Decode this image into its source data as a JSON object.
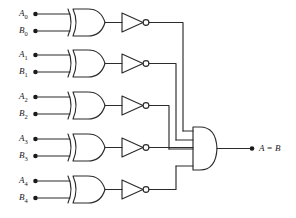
{
  "diagram": {
    "stroke_color": "#2b2b2b",
    "background_color": "#ffffff",
    "text_color": "#1a1a1a",
    "bit_count": 5
  },
  "inputs": [
    {
      "a_label": "A",
      "a_sub": "0",
      "b_label": "B",
      "b_sub": "0",
      "a_y": 14,
      "b_y": 31
    },
    {
      "a_label": "A",
      "a_sub": "1",
      "b_label": "B",
      "b_sub": "1",
      "a_y": 55,
      "b_y": 72
    },
    {
      "a_label": "A",
      "a_sub": "2",
      "b_label": "B",
      "b_sub": "2",
      "a_y": 97,
      "b_y": 114
    },
    {
      "a_label": "A",
      "a_sub": "3",
      "b_label": "B",
      "b_sub": "3",
      "a_y": 139,
      "b_y": 156
    },
    {
      "a_label": "A",
      "a_sub": "4",
      "b_label": "B",
      "b_sub": "4",
      "a_y": 181,
      "b_y": 198
    }
  ],
  "gates": {
    "xor_name": "xor-gate",
    "inverter_name": "inverter-gate",
    "and_name": "and-gate",
    "xor_count": 5,
    "inverter_count": 5,
    "and_inputs": 5
  },
  "output": {
    "label": "A = B",
    "terminal_x": 252,
    "terminal_y": 148
  }
}
